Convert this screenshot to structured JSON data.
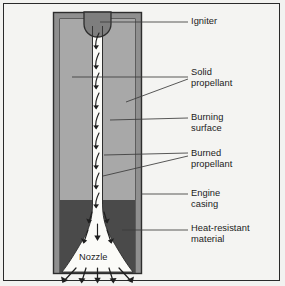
{
  "figure": {
    "kind": "labeled-cross-section-diagram",
    "background_color": "#f2f2f0",
    "border_color": "#2a2a2a"
  },
  "colors": {
    "engine_casing": "#8f8f8f",
    "solid_propellant": "#a8a8a8",
    "burned_channel": "#fbfbf8",
    "heat_resistant_material": "#4a4a4a",
    "igniter": "#7e7e7e",
    "outline": "#2d2d2d",
    "leader_line": "#3b3b3b",
    "text": "#1b1b1b"
  },
  "callouts": [
    {
      "id": "igniter",
      "label": "Igniter",
      "x": 191,
      "y": 16
    },
    {
      "id": "solid-propellant",
      "label": "Solid\npropellant",
      "x": 191,
      "y": 67
    },
    {
      "id": "burning-surface",
      "label": "Burning\nsurface",
      "x": 191,
      "y": 112
    },
    {
      "id": "burned-propellant",
      "label": "Burned\npropellant",
      "x": 191,
      "y": 148
    },
    {
      "id": "engine-casing",
      "label": "Engine\ncasing",
      "x": 191,
      "y": 188
    },
    {
      "id": "heat-resistant-material",
      "label": "Heat-resistant\nmaterial",
      "x": 191,
      "y": 223
    }
  ],
  "inline_labels": [
    {
      "id": "nozzle",
      "label": "Nozzle",
      "x": 79,
      "y": 252
    }
  ],
  "leader_lines": [
    {
      "for": "igniter",
      "points": "100,22 188,22"
    },
    {
      "for": "solid-propellant",
      "points": "72,77 188,77"
    },
    {
      "for": "solid-propellant-2",
      "points": "126,102 188,79"
    },
    {
      "for": "burning-surface",
      "points": "110,120 188,118"
    },
    {
      "for": "burned-propellant",
      "points": "104,155 188,153"
    },
    {
      "for": "burned-propellant-2",
      "points": "103,176 188,156"
    },
    {
      "for": "engine-casing",
      "points": "141,194 188,194"
    },
    {
      "for": "heat-resistant-material",
      "points": "122,230 188,230"
    }
  ],
  "geometry": {
    "casing_outer": {
      "x": 53,
      "y": 12,
      "w": 89,
      "h": 262
    },
    "casing_wall_thickness": 6,
    "propellant_top": 18,
    "heat_material_top": 200,
    "channel_half_width": 5,
    "channel_top": 37,
    "nozzle_throat_y": 238,
    "nozzle_exit_y": 272
  },
  "flow_arrows": {
    "internal_count": 9,
    "nozzle_count": 4,
    "exhaust_count": 5,
    "description": "curved downward arrows in the burned-propellant channel, straight arrows through the nozzle throat, and a fan of exhaust arrows below the engine exit"
  }
}
